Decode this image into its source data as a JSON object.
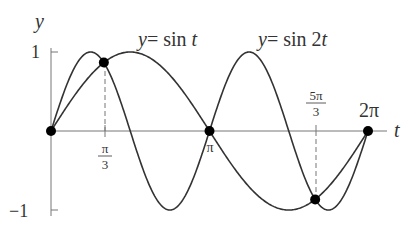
{
  "chart_data": {
    "type": "line",
    "title": "",
    "xlabel": "t",
    "ylabel": "y",
    "xlim": [
      0,
      6.6
    ],
    "ylim": [
      -1,
      1
    ],
    "grid": false,
    "series": [
      {
        "name": "y = sin t",
        "function": "sin(t)",
        "domain": [
          0,
          6.2832
        ]
      },
      {
        "name": "y = sin 2t",
        "function": "sin(2t)",
        "domain": [
          0,
          6.2832
        ]
      }
    ],
    "x_ticks": [
      {
        "label": "π/3",
        "value": 1.0472
      },
      {
        "label": "π",
        "value": 3.1416
      },
      {
        "label": "5π/3",
        "value": 5.236
      },
      {
        "label": "2π",
        "value": 6.2832
      }
    ],
    "y_ticks": [
      {
        "label": "1",
        "value": 1
      },
      {
        "label": "−1",
        "value": -1
      }
    ],
    "intersection_points": [
      {
        "t": 0,
        "y": 0
      },
      {
        "t": 1.0472,
        "y": 0.866
      },
      {
        "t": 3.1416,
        "y": 0
      },
      {
        "t": 5.236,
        "y": -0.866
      },
      {
        "t": 6.2832,
        "y": 0
      }
    ],
    "annotations": [
      {
        "text": "y = sin t",
        "position": "above sin t peak"
      },
      {
        "text": "y = sin 2t",
        "position": "above second sin 2t peak"
      }
    ]
  },
  "labels": {
    "y_axis": "y",
    "t_axis": "t",
    "tick_1": "1",
    "tick_neg1": "−1",
    "pi3_num": "π",
    "pi3_den": "3",
    "pi": "π",
    "fivepi3_num": "5π",
    "fivepi3_den": "3",
    "twopi": "2π",
    "eq_sin_t_lhs": "y",
    "eq_sin_t_rhs": "= sin ",
    "eq_sin_t_var": "t",
    "eq_sin_2t_lhs": "y",
    "eq_sin_2t_rhs": "= sin 2",
    "eq_sin_2t_var": "t"
  },
  "colors": {
    "curve": "#333333",
    "axis": "#555555",
    "point": "#000000"
  }
}
